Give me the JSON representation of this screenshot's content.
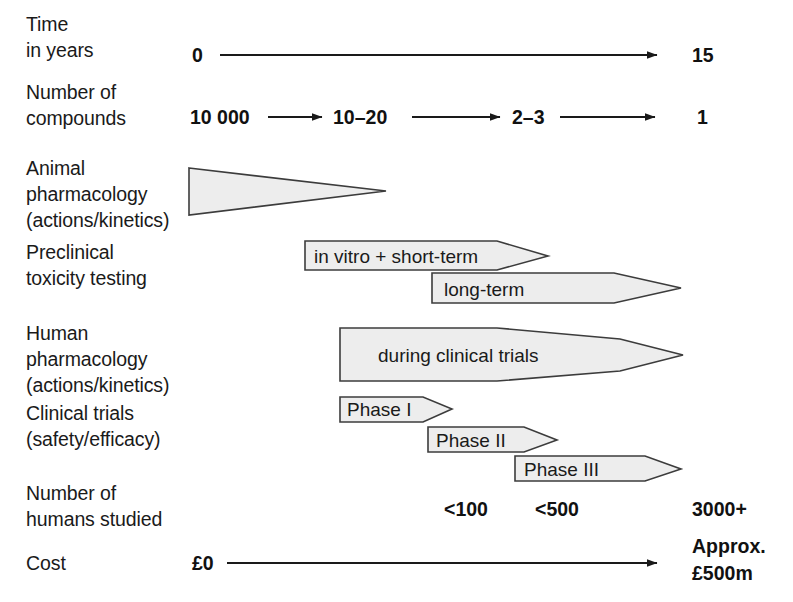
{
  "figure": {
    "rows": [
      {
        "id": "time",
        "label_lines": [
          "Time",
          "in years"
        ],
        "start_value": "0",
        "end_value": "15"
      },
      {
        "id": "compounds",
        "label_lines": [
          "Number of",
          "compounds"
        ],
        "values": [
          "10 000",
          "10–20",
          "2–3",
          "1"
        ]
      },
      {
        "id": "animal-pharmacology",
        "label_lines": [
          "Animal",
          "pharmacology",
          "(actions/kinetics)"
        ],
        "bands": [
          {
            "text": "",
            "shape": "tapering-wedge"
          }
        ]
      },
      {
        "id": "preclinical-toxicity",
        "label_lines": [
          "Preclinical",
          "toxicity testing"
        ],
        "bands": [
          {
            "text": "in vitro + short-term",
            "shape": "arrow"
          },
          {
            "text": "long-term",
            "shape": "arrow"
          }
        ]
      },
      {
        "id": "human-pharmacology",
        "label_lines": [
          "Human",
          "pharmacology",
          "(actions/kinetics)"
        ],
        "bands": [
          {
            "text": "during clinical trials",
            "shape": "long-taper-arrow"
          }
        ]
      },
      {
        "id": "clinical-trials",
        "label_lines": [
          "Clinical trials",
          "(safety/efficacy)"
        ],
        "bands": [
          {
            "text": "Phase I",
            "shape": "arrow"
          },
          {
            "text": "Phase II",
            "shape": "arrow"
          },
          {
            "text": "Phase III",
            "shape": "arrow"
          }
        ]
      },
      {
        "id": "humans-studied",
        "label_lines": [
          "Number of",
          "humans studied"
        ],
        "values": [
          "<100",
          "<500",
          "3000+"
        ]
      },
      {
        "id": "cost",
        "label_lines": [
          "Cost"
        ],
        "start_value": "£0",
        "end_value_lines": [
          "Approx.",
          "£500m"
        ]
      }
    ]
  },
  "colors": {
    "band_fill": "#ededed",
    "band_stroke": "#3c3c3c",
    "ink": "#1a1a1a",
    "background": "#ffffff"
  }
}
